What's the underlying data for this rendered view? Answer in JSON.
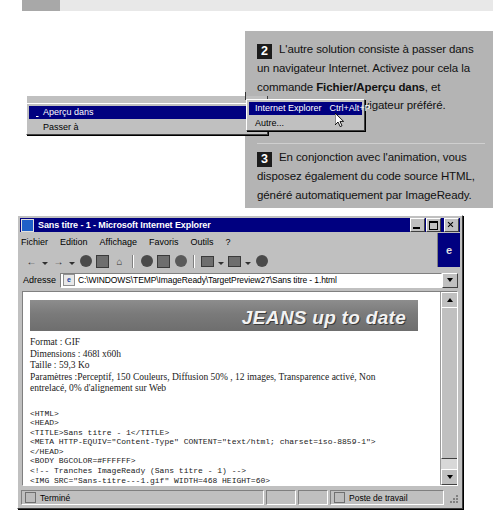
{
  "callouts": [
    {
      "number": "2",
      "segments": [
        {
          "text": "L'autre solution consiste à passer dans un navigateur Internet. Activez pour cela la commande ",
          "bold": false
        },
        {
          "text": "Fichier/Aperçu dans",
          "bold": true
        },
        {
          "text": ", et sélectionnez votre navigateur préféré.",
          "bold": false
        }
      ],
      "plain": "L'autre solution consiste à passer dans un navigateur Internet. Activez pour cela la commande Fichier/Aperçu dans, et sélectionnez votre navigateur préféré."
    },
    {
      "number": "3",
      "segments": [
        {
          "text": "En conjonction avec l'animation, vous disposez également du code source HTML, généré automatiquement par ImageReady.",
          "bold": false
        }
      ],
      "plain": "En conjonction avec l'animation, vous disposez également du code source HTML, généré automatiquement par ImageReady."
    }
  ],
  "context_menu": {
    "items": [
      {
        "label": "Aperçu dans",
        "mnemonic": "d",
        "selected": true,
        "has_submenu": true
      },
      {
        "label": "Passer à",
        "mnemonic": "P",
        "selected": false,
        "has_submenu": true
      }
    ]
  },
  "submenu": {
    "items": [
      {
        "label": "Internet Explorer",
        "shortcut": "Ctrl+Alt+P",
        "selected": true
      },
      {
        "label": "Autre...",
        "shortcut": "",
        "selected": false
      }
    ]
  },
  "browser": {
    "title": "Sans titre - 1 - Microsoft Internet Explorer",
    "window_buttons": {
      "minimize": "_",
      "maximize": "□",
      "close": "×"
    },
    "menubar": [
      "Fichier",
      "Edition",
      "Affichage",
      "Favoris",
      "Outils",
      "?"
    ],
    "logo_letter": "e",
    "toolbar_icons": [
      "back-icon",
      "forward-icon",
      "stop-icon",
      "refresh-icon",
      "home-icon",
      "search-icon",
      "favorites-icon",
      "history-icon",
      "mail-icon",
      "print-icon",
      "edit-icon"
    ],
    "address": {
      "label": "Adresse",
      "value": "C:\\WINDOWS\\TEMP\\ImageReady\\TargetPreview27\\Sans titre - 1.html",
      "placeholder": "Adresse"
    },
    "status": {
      "text": "Terminé",
      "zone": "Poste de travail"
    }
  },
  "page": {
    "banner_text": "JEANS up to date",
    "info_lines": [
      "Format : GIF",
      "Dimensions : 468l x60h",
      "Taille : 59,3 Ko",
      "Paramètres :Perceptif, 150 Couleurs, Diffusion 50% , 12 images, Transparence activé, Non",
      "entrelacé, 0% d'alignement sur Web"
    ],
    "code": "<HTML>\n<HEAD>\n<TITLE>Sans titre - 1</TITLE>\n<META HTTP-EQUIV=\"Content-Type\" CONTENT=\"text/html; charset=iso-8859-1\">\n</HEAD>\n<BODY BGCOLOR=#FFFFFF>\n<!-- Tranches ImageReady (Sans titre - 1) -->\n<IMG SRC=\"Sans-titre---1.gif\" WIDTH=468 HEIGHT=60>"
  },
  "colors": {
    "menu_highlight": "#000080",
    "window_face": "#c0c0c0",
    "callout_panel": "#b4b4b4",
    "step_badge": "#1c1c1c"
  }
}
